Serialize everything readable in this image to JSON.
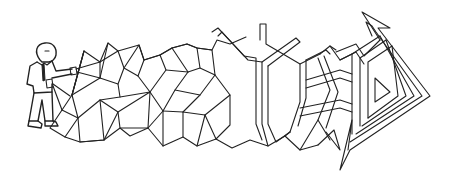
{
  "illustration": {
    "subject": "man in suit pulling a tangled mesh that turns into a maze-like arrow",
    "stroke_color": "#222222",
    "background_color": "#ffffff",
    "elements": [
      {
        "name": "businessman",
        "description": "cartoon man with round head, shirt and tie, holding strings"
      },
      {
        "name": "triangle-mesh",
        "description": "network of triangular facets in the middle"
      },
      {
        "name": "maze-arrow",
        "description": "parallel-line maze path ending in an arrowhead pointing up-right"
      }
    ]
  }
}
